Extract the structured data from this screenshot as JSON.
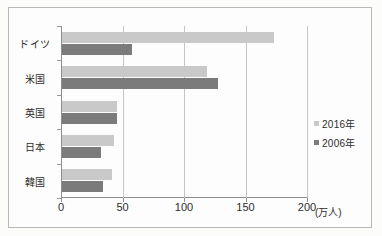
{
  "chart_data": {
    "type": "bar",
    "orientation": "horizontal",
    "title": "",
    "xlabel": "(万人)",
    "ylabel": "",
    "xlim": [
      0,
      200
    ],
    "xticks": [
      0,
      50,
      100,
      150,
      200
    ],
    "xtick_labels": [
      "0",
      "50",
      "100",
      "150",
      "200"
    ],
    "grid": true,
    "grid_axis": "x",
    "legend_position": "right",
    "categories": [
      "ドイツ",
      "米国",
      "英国",
      "日本",
      "韓国"
    ],
    "series": [
      {
        "name": "2016年",
        "color": "#c9c9c9",
        "values": [
          172,
          118,
          45,
          42,
          41
        ]
      },
      {
        "name": "2006年",
        "color": "#7b7b7b",
        "values": [
          57,
          127,
          45,
          32,
          33
        ]
      }
    ]
  },
  "axis": {
    "unit_label": "(万人)",
    "ticks": [
      {
        "label": "0",
        "value": 0
      },
      {
        "label": "50",
        "value": 50
      },
      {
        "label": "100",
        "value": 100
      },
      {
        "label": "150",
        "value": 150
      },
      {
        "label": "200",
        "value": 200
      }
    ]
  },
  "categories": [
    {
      "label": "ドイツ",
      "v2016": 172,
      "v2006": 57
    },
    {
      "label": "米国",
      "v2016": 118,
      "v2006": 127
    },
    {
      "label": "英国",
      "v2016": 45,
      "v2006": 45
    },
    {
      "label": "日本",
      "v2016": 42,
      "v2006": 32
    },
    {
      "label": "韓国",
      "v2016": 41,
      "v2006": 33
    }
  ],
  "legend": {
    "items": [
      {
        "label": "2016年",
        "color": "#c9c9c9"
      },
      {
        "label": "2006年",
        "color": "#7b7b7b"
      }
    ]
  },
  "colors": {
    "series_2016": "#c9c9c9",
    "series_2006": "#7b7b7b",
    "axis": "#8d8d8d",
    "grid": "#c5c5c5",
    "frame": "#b9b9b9",
    "text": "#2c2c2c",
    "background": "#fdfdfd"
  }
}
